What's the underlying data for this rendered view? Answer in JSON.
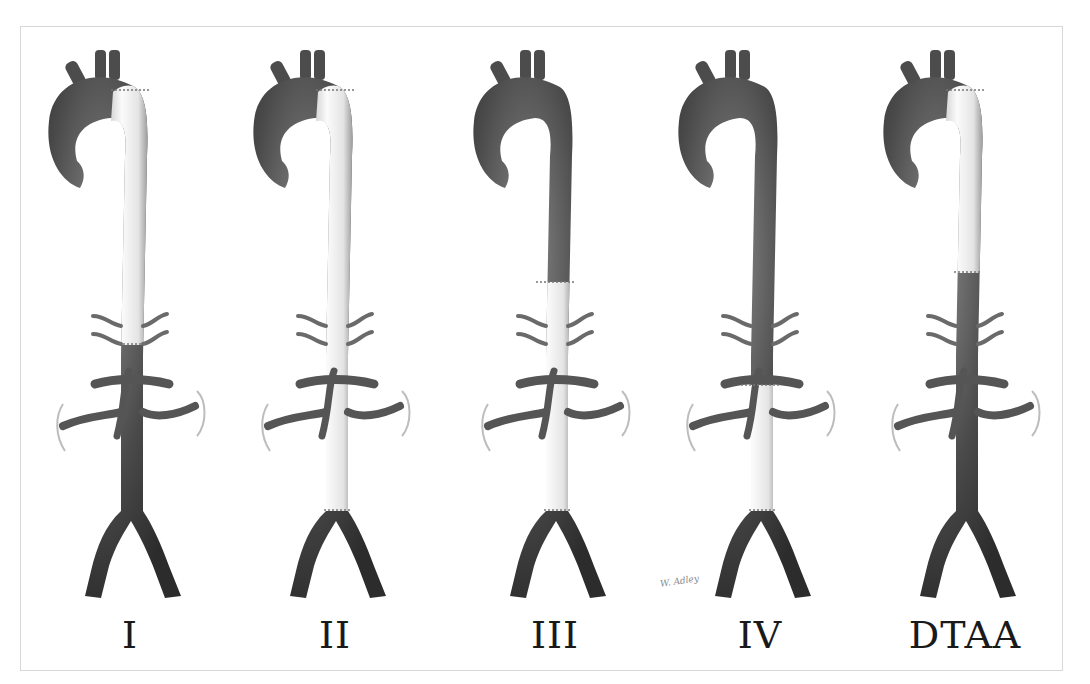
{
  "figure": {
    "colors": {
      "native_aorta_dark": "#3a3a3a",
      "native_aorta_light": "#8c8c8c",
      "graft_light": "#f4f4f4",
      "graft_shade": "#bdbdbd",
      "branch": "#5e5e5e",
      "frame_border": "#d8d8d8",
      "label_text": "#1a1a1a"
    },
    "panels": [
      {
        "id": "I",
        "label": "I",
        "center_x": 130,
        "graft": {
          "from": "distal-arch",
          "to": "renal-arteries",
          "top_y": 0,
          "bottom_y": 318
        }
      },
      {
        "id": "II",
        "label": "II",
        "center_x": 335,
        "graft": {
          "from": "distal-arch",
          "to": "aortic-bifurcation",
          "top_y": 0,
          "bottom_y": 484
        }
      },
      {
        "id": "III",
        "label": "III",
        "center_x": 555,
        "graft": {
          "from": "mid-descending-thoracic",
          "to": "aortic-bifurcation",
          "top_y": 196,
          "bottom_y": 484
        }
      },
      {
        "id": "IV",
        "label": "IV",
        "center_x": 760,
        "graft": {
          "from": "diaphragm",
          "to": "aortic-bifurcation",
          "top_y": 299,
          "bottom_y": 484
        }
      },
      {
        "id": "DTAA",
        "label": "DTAA",
        "center_x": 965,
        "graft": {
          "from": "distal-arch",
          "to": "mid-descending-thoracic",
          "top_y": 0,
          "bottom_y": 246
        }
      }
    ],
    "signature": "W. Adley"
  }
}
